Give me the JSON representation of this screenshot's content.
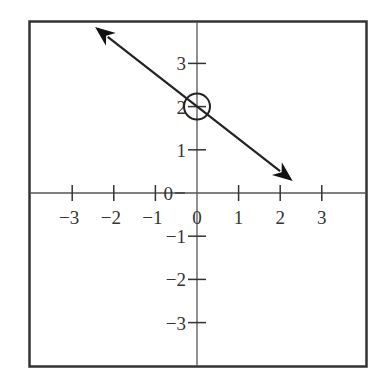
{
  "chart_data": {
    "type": "line",
    "title": "",
    "xlabel": "",
    "ylabel": "",
    "xlim": [
      -4,
      4
    ],
    "ylim": [
      -4,
      4
    ],
    "grid": false,
    "x_ticks": [
      -3,
      -2,
      -1,
      0,
      1,
      2,
      3
    ],
    "y_ticks": [
      3,
      2,
      1,
      0,
      -1,
      -2,
      -3
    ],
    "x_tick_labels": [
      "−3",
      "−2",
      "−1",
      "0",
      "1",
      "2",
      "3"
    ],
    "y_tick_labels": [
      "3",
      "2",
      "1",
      "0",
      "−1",
      "−2",
      "−3"
    ],
    "series": [
      {
        "name": "line",
        "equation": "y = -0.75x + 2",
        "slope": -0.75,
        "intercept": 2,
        "x": [
          -2.45,
          2.3
        ],
        "y": [
          3.84,
          0.28
        ],
        "arrows": "both"
      }
    ],
    "annotations": [
      {
        "type": "open-circle",
        "x": 0,
        "y": 2,
        "note": "y-intercept highlighted"
      }
    ]
  },
  "colors": {
    "frame": "#333333",
    "axis": "#555555",
    "line": "#222222",
    "background": "#ffffff"
  }
}
